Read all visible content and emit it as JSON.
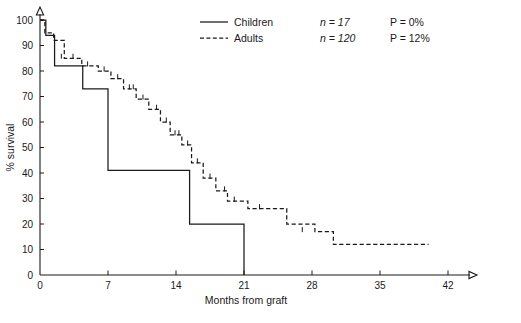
{
  "chart_data": {
    "type": "line",
    "subtype": "kaplan-meier-step",
    "title": "",
    "xlabel": "Months from graft",
    "ylabel": "% survival",
    "xlim": [
      0,
      42
    ],
    "ylim": [
      0,
      100
    ],
    "xticks": [
      0,
      7,
      14,
      21,
      28,
      35,
      42
    ],
    "xtick_labels": [
      "0",
      "7",
      "14",
      "21",
      "28",
      "35",
      "42"
    ],
    "yticks": [
      0,
      10,
      20,
      30,
      40,
      50,
      60,
      70,
      80,
      90,
      100
    ],
    "ytick_labels": [
      "0",
      "10",
      "20",
      "30",
      "40",
      "50",
      "60",
      "70",
      "80",
      "90",
      "100"
    ],
    "grid": false,
    "legend_position": "top-center",
    "axis_arrows": true,
    "series": [
      {
        "name": "Children",
        "style": "solid",
        "n": 17,
        "n_label": "n = 17",
        "p_label": "P = 0%",
        "p_value": "0%",
        "color": "#1a1a1a",
        "x": [
          0.0,
          0.6,
          0.6,
          1.5,
          1.5,
          4.4,
          4.4,
          7.0,
          7.0,
          15.4,
          15.4,
          21.0,
          21.0
        ],
        "y": [
          100,
          100,
          94,
          94,
          82,
          82,
          73,
          73,
          41,
          41,
          20,
          20,
          0
        ],
        "steps": [
          {
            "time": 0.0,
            "survival": 100
          },
          {
            "time": 0.6,
            "survival": 94
          },
          {
            "time": 1.5,
            "survival": 82
          },
          {
            "time": 4.4,
            "survival": 73
          },
          {
            "time": 7.0,
            "survival": 41
          },
          {
            "time": 15.4,
            "survival": 20
          },
          {
            "time": 21.0,
            "survival": 0
          }
        ],
        "censored": []
      },
      {
        "name": "Adults",
        "style": "dashed",
        "n": 120,
        "n_label": "n = 120",
        "p_label": "P = 12%",
        "p_value": "12%",
        "color": "#1a1a1a",
        "steps": [
          {
            "time": 0.0,
            "survival": 100
          },
          {
            "time": 0.5,
            "survival": 95
          },
          {
            "time": 1.4,
            "survival": 92
          },
          {
            "time": 2.5,
            "survival": 85
          },
          {
            "time": 4.3,
            "survival": 82
          },
          {
            "time": 6.0,
            "survival": 80
          },
          {
            "time": 7.3,
            "survival": 77
          },
          {
            "time": 8.6,
            "survival": 73
          },
          {
            "time": 9.9,
            "survival": 69
          },
          {
            "time": 11.2,
            "survival": 65
          },
          {
            "time": 12.4,
            "survival": 60
          },
          {
            "time": 13.4,
            "survival": 55
          },
          {
            "time": 14.6,
            "survival": 51
          },
          {
            "time": 15.6,
            "survival": 44
          },
          {
            "time": 16.8,
            "survival": 38
          },
          {
            "time": 18.1,
            "survival": 33
          },
          {
            "time": 19.3,
            "survival": 29
          },
          {
            "time": 21.4,
            "survival": 26
          },
          {
            "time": 25.0,
            "survival": 26
          },
          {
            "time": 25.4,
            "survival": 20
          },
          {
            "time": 28.3,
            "survival": 17
          },
          {
            "time": 30.2,
            "survival": 12
          },
          {
            "time": 40.0,
            "survival": 12
          }
        ],
        "censored": [
          {
            "time": 2.2,
            "survival": 85
          },
          {
            "time": 3.4,
            "survival": 85
          },
          {
            "time": 4.9,
            "survival": 82
          },
          {
            "time": 6.6,
            "survival": 80
          },
          {
            "time": 8.0,
            "survival": 77
          },
          {
            "time": 9.2,
            "survival": 73
          },
          {
            "time": 9.6,
            "survival": 73
          },
          {
            "time": 10.6,
            "survival": 69
          },
          {
            "time": 12.0,
            "survival": 65
          },
          {
            "time": 13.0,
            "survival": 60
          },
          {
            "time": 13.9,
            "survival": 55
          },
          {
            "time": 14.3,
            "survival": 55
          },
          {
            "time": 15.2,
            "survival": 51
          },
          {
            "time": 16.2,
            "survival": 44
          },
          {
            "time": 17.5,
            "survival": 38
          },
          {
            "time": 19.0,
            "survival": 33
          },
          {
            "time": 20.0,
            "survival": 29
          },
          {
            "time": 22.6,
            "survival": 26
          },
          {
            "time": 27.0,
            "survival": 17
          }
        ]
      }
    ]
  },
  "legend": {
    "entries": [
      {
        "label": "Children",
        "n": "n = 17",
        "p": "P = 0%",
        "sample": "solid-line-sample"
      },
      {
        "label": "Adults",
        "n": "n = 120",
        "p": "P = 12%",
        "sample": "dashed-line-sample"
      }
    ]
  },
  "axes": {
    "x_title": "Months from graft",
    "y_title": "% survival"
  }
}
